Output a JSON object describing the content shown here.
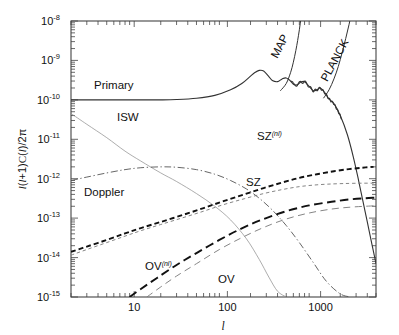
{
  "figure": {
    "background": "#ffffff",
    "frame_color": "#444444"
  },
  "axes": {
    "x": {
      "label": "l",
      "scale": "log",
      "range": [
        2,
        5000
      ],
      "ticks": [
        10,
        100,
        1000
      ],
      "tick_labels": [
        "10",
        "100",
        "1000"
      ]
    },
    "y": {
      "label_parts": {
        "l1": "l",
        "p1": "(",
        "l2": "l",
        "plus": "+1)",
        "c": "C",
        "p2": "(",
        "l3": "l",
        "p3": ")/2",
        "pi": "π"
      },
      "label_plain": "l(l+1)C(l)/2π",
      "scale": "log",
      "range": [
        1e-15,
        1e-08
      ],
      "tick_mantissa": "10",
      "tick_exponents": [
        "-8",
        "-9",
        "-10",
        "-11",
        "-12",
        "-13",
        "-14",
        "-15"
      ]
    }
  },
  "curve_labels": {
    "primary": "Primary",
    "isw": "ISW",
    "doppler": "Doppler",
    "sz": "SZ",
    "sz_nl_base": "SZ",
    "sz_nl_sup": "(nl)",
    "ov": "OV",
    "ov_nl_base": "OV",
    "ov_nl_sup": "(nl)",
    "map": "MAP",
    "planck": "PLANCK"
  },
  "chart_data": {
    "type": "line",
    "title": "",
    "xlabel": "l",
    "ylabel": "l(l+1)C(l)/2π",
    "xscale": "log",
    "yscale": "log",
    "xlim": [
      2,
      5000
    ],
    "ylim": [
      1e-15,
      1e-08
    ],
    "xticks": [
      10,
      100,
      1000
    ],
    "yticks": [
      1e-15,
      1e-14,
      1e-13,
      1e-12,
      1e-11,
      1e-10,
      1e-09,
      1e-08
    ],
    "grid": false,
    "legend": "inline-annotations",
    "series": [
      {
        "name": "Primary",
        "style": "solid",
        "width": 1.1,
        "color": "#333333",
        "x": [
          2,
          3,
          5,
          8,
          12,
          20,
          30,
          50,
          80,
          120,
          160,
          200,
          220,
          250,
          280,
          320,
          350,
          400,
          450,
          500,
          550,
          600,
          660,
          720,
          800,
          900,
          1000,
          1100,
          1200,
          1350,
          1500,
          1700,
          2000,
          2400,
          2800,
          3200,
          3600,
          4000,
          4500,
          5000
        ],
        "y": [
          1e-10,
          1e-10,
          1e-10,
          1e-10,
          1e-10,
          1e-10,
          1.02e-10,
          1.1e-10,
          1.3e-10,
          1.8e-10,
          2.6e-10,
          4e-10,
          4.8e-10,
          5.6e-10,
          5.4e-10,
          3.9e-10,
          3.1e-10,
          2.9e-10,
          3.4e-10,
          3.6e-10,
          3.1e-10,
          2.5e-10,
          2.4e-10,
          2.8e-10,
          2.9e-10,
          2.2e-10,
          1.7e-10,
          1.8e-10,
          2e-10,
          1.5e-10,
          1.05e-10,
          8e-11,
          4e-11,
          1.3e-11,
          3.5e-12,
          9e-13,
          2.5e-13,
          8e-14,
          2.2e-14,
          7e-15
        ]
      },
      {
        "name": "ISW",
        "style": "thin-solid",
        "width": 0.7,
        "color": "#8a8a8a",
        "x": [
          2,
          3,
          5,
          8,
          12,
          20,
          30,
          50,
          80,
          120,
          180,
          250,
          320,
          400,
          500
        ],
        "y": [
          4.5e-11,
          2.4e-11,
          1.1e-11,
          5e-12,
          2.8e-12,
          1.4e-12,
          8.5e-13,
          4.2e-13,
          2e-13,
          9e-14,
          3e-14,
          9e-15,
          3.2e-15,
          1.4e-15,
          1e-15
        ]
      },
      {
        "name": "Doppler",
        "style": "dash-dot",
        "width": 0.9,
        "color": "#555555",
        "x": [
          2,
          3,
          5,
          8,
          12,
          20,
          30,
          50,
          80,
          120,
          180,
          250,
          350,
          500,
          700,
          1000,
          1400,
          2000,
          2600
        ],
        "y": [
          9e-13,
          1.1e-12,
          1.4e-12,
          1.7e-12,
          1.9e-12,
          2e-12,
          1.95e-12,
          1.7e-12,
          1.3e-12,
          9e-13,
          5.5e-13,
          3.2e-13,
          1.6e-13,
          6.5e-14,
          2.4e-14,
          7.5e-15,
          2.5e-15,
          1.2e-15,
          1e-15
        ]
      },
      {
        "name": "SZ(nl)",
        "style": "short-dash-bold",
        "width": 1.9,
        "color": "#111111",
        "x": [
          2,
          3,
          5,
          8,
          12,
          20,
          35,
          60,
          100,
          170,
          280,
          450,
          700,
          1100,
          1700,
          2500,
          3500,
          4700
        ],
        "y": [
          1.4e-14,
          1.9e-14,
          2.8e-14,
          4.1e-14,
          5.6e-14,
          8e-14,
          1.2e-13,
          1.8e-13,
          2.7e-13,
          4e-13,
          5.8e-13,
          8e-13,
          1.05e-12,
          1.3e-12,
          1.55e-12,
          1.75e-12,
          1.9e-12,
          2e-12
        ]
      },
      {
        "name": "SZ",
        "style": "short-dash-thin",
        "width": 0.9,
        "color": "#777777",
        "x": [
          2,
          3,
          5,
          8,
          12,
          20,
          35,
          60,
          100,
          170,
          280,
          450,
          700,
          1100,
          1700,
          2500,
          3500,
          4700
        ],
        "y": [
          1.15e-14,
          1.6e-14,
          2.4e-14,
          3.5e-14,
          4.8e-14,
          6.9e-14,
          1.02e-13,
          1.5e-13,
          2.2e-13,
          3.1e-13,
          4.2e-13,
          5.3e-13,
          6.3e-13,
          7e-13,
          7.4e-13,
          7.6e-13,
          7.7e-13,
          7.7e-13
        ]
      },
      {
        "name": "OV(nl)",
        "style": "long-dash-bold",
        "width": 1.9,
        "color": "#111111",
        "x": [
          9,
          12,
          18,
          30,
          50,
          90,
          160,
          280,
          500,
          900,
          1600,
          2600,
          3800,
          4800
        ],
        "y": [
          1e-15,
          1.6e-15,
          3e-15,
          6.5e-15,
          1.3e-14,
          2.8e-14,
          5.5e-14,
          9.5e-14,
          1.5e-13,
          2.1e-13,
          2.6e-13,
          3e-13,
          3.2e-13,
          3.3e-13
        ]
      },
      {
        "name": "OV",
        "style": "long-dash-thin",
        "width": 0.9,
        "color": "#777777",
        "x": [
          14,
          20,
          30,
          50,
          90,
          160,
          280,
          500,
          900,
          1600,
          2600,
          3800,
          4800
        ],
        "y": [
          1e-15,
          1.8e-15,
          3.4e-15,
          7e-15,
          1.6e-14,
          3.2e-14,
          5.8e-14,
          9.5e-14,
          1.35e-13,
          1.7e-13,
          1.9e-13,
          2e-13,
          2.05e-13
        ]
      },
      {
        "name": "MAP",
        "style": "solid",
        "width": 1.0,
        "color": "#333333",
        "note": "detector noise curve rising steeply",
        "x": [
          430,
          500,
          560,
          600,
          640,
          670,
          700,
          730,
          760,
          790
        ],
        "y": [
          1.7e-10,
          2.6e-10,
          5e-10,
          9e-10,
          1.8e-09,
          3.2e-09,
          6e-09,
          1.2e-08,
          2.4e-08,
          5e-08
        ]
      },
      {
        "name": "PLANCK",
        "style": "solid",
        "width": 1.0,
        "color": "#333333",
        "note": "detector noise curve rising steeply",
        "x": [
          1300,
          1500,
          1700,
          1900,
          2100,
          2300,
          2500,
          2700,
          2900
        ],
        "y": [
          1.1e-10,
          1.8e-10,
          3.4e-10,
          7e-10,
          1.6e-09,
          3.6e-09,
          8e-09,
          1.8e-08,
          4e-08
        ]
      }
    ]
  }
}
